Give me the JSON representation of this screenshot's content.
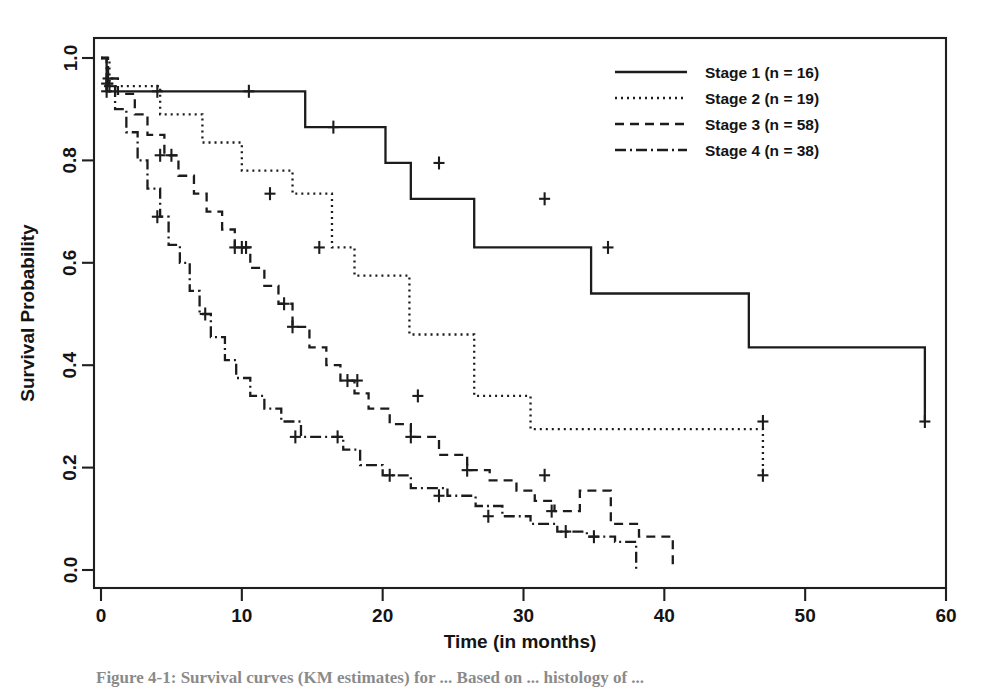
{
  "figure": {
    "caption": "Figure 4-1: Survival curves (KM estimates) for ... Based on ... histology of ...",
    "background_color": "#ffffff",
    "ink_color": "#1c1c1c"
  },
  "chart_data": {
    "type": "line",
    "subtype": "kaplan-meier-step",
    "title": "",
    "xlabel": "Time (in months)",
    "ylabel": "Survival Probability",
    "xlim": [
      0,
      60
    ],
    "ylim": [
      0,
      1.0
    ],
    "xticks": [
      0,
      10,
      20,
      30,
      40,
      50,
      60
    ],
    "xtick_labels": [
      "0",
      "10",
      "20",
      "30",
      "40",
      "50",
      "60"
    ],
    "yticks": [
      0.0,
      0.2,
      0.4,
      0.6,
      0.8,
      1.0
    ],
    "ytick_labels": [
      "0.0",
      "0.2",
      "0.4",
      "0.6",
      "0.8",
      "1.0"
    ],
    "grid": false,
    "legend_position": "top-right",
    "series": [
      {
        "name": "Stage 1 (n = 16)",
        "legend_label": "Stage 1 (n = 16)",
        "n": 16,
        "stage": 1,
        "line_style": "solid",
        "dash_pattern": "none",
        "x": [
          0,
          0.4,
          7.5,
          14.5,
          20.2,
          22.0,
          26.5,
          34.8,
          46.0,
          58.5
        ],
        "y": [
          1.0,
          0.935,
          0.935,
          0.865,
          0.795,
          0.725,
          0.63,
          0.54,
          0.435,
          0.29
        ],
        "censor_times": [
          0.4,
          4.0,
          10.5,
          16.5,
          24.0,
          31.5,
          36.0,
          47.0,
          58.5
        ],
        "censor_probs": [
          0.935,
          0.935,
          0.935,
          0.865,
          0.795,
          0.725,
          0.63,
          0.29,
          0.29
        ]
      },
      {
        "name": "Stage 2 (n = 19)",
        "legend_label": "Stage 2 (n = 19)",
        "n": 19,
        "stage": 2,
        "line_style": "dotted",
        "dash_pattern": "2 4",
        "x": [
          0,
          0.6,
          4.2,
          7.2,
          10.0,
          13.6,
          16.4,
          18.0,
          21.9,
          26.5,
          30.5,
          47.0
        ],
        "y": [
          1.0,
          0.945,
          0.89,
          0.835,
          0.78,
          0.735,
          0.63,
          0.575,
          0.46,
          0.34,
          0.275,
          0.185
        ],
        "censor_times": [
          0.6,
          12.0,
          15.5,
          22.5,
          31.5,
          47.0
        ],
        "censor_probs": [
          0.945,
          0.735,
          0.63,
          0.34,
          0.185,
          0.185
        ]
      },
      {
        "name": "Stage 3 (n = 58)",
        "legend_label": "Stage 3 (n = 58)",
        "n": 58,
        "stage": 3,
        "line_style": "dashed",
        "dash_pattern": "9 6",
        "x": [
          0,
          0.5,
          1.2,
          2.4,
          3.3,
          4.5,
          5.5,
          6.6,
          7.5,
          8.6,
          9.5,
          10.6,
          11.6,
          12.6,
          13.6,
          14.8,
          16.0,
          17.0,
          18.0,
          19.0,
          20.5,
          22.0,
          24.0,
          26.0,
          27.6,
          29.5,
          30.8,
          32.2,
          34.0,
          36.2,
          38.2,
          40.6
        ],
        "y": [
          1.0,
          0.96,
          0.93,
          0.89,
          0.85,
          0.81,
          0.77,
          0.735,
          0.7,
          0.665,
          0.63,
          0.59,
          0.555,
          0.52,
          0.475,
          0.435,
          0.4,
          0.37,
          0.345,
          0.315,
          0.285,
          0.26,
          0.225,
          0.195,
          0.175,
          0.155,
          0.135,
          0.115,
          0.155,
          0.09,
          0.065,
          0.01
        ],
        "censor_times": [
          0.5,
          4.2,
          5.0,
          9.5,
          10.0,
          10.3,
          13.0,
          13.6,
          17.5,
          18.2,
          22.0,
          26.0,
          32.0
        ],
        "censor_probs": [
          0.96,
          0.81,
          0.81,
          0.63,
          0.63,
          0.63,
          0.52,
          0.475,
          0.37,
          0.37,
          0.26,
          0.195,
          0.115
        ]
      },
      {
        "name": "Stage 4 (n = 38)",
        "legend_label": "Stage 4 (n = 38)",
        "n": 38,
        "stage": 4,
        "line_style": "dash-dot",
        "dash_pattern": "11 4 2 4",
        "x": [
          0,
          0.4,
          1.0,
          1.8,
          2.6,
          3.3,
          4.2,
          4.8,
          5.6,
          6.3,
          7.0,
          7.8,
          8.8,
          9.6,
          10.6,
          11.6,
          12.8,
          14.2,
          15.6,
          17.2,
          18.4,
          20.0,
          22.0,
          24.6,
          26.6,
          28.5,
          30.5,
          32.4,
          34.5,
          36.5,
          38.0
        ],
        "y": [
          1.0,
          0.95,
          0.9,
          0.855,
          0.8,
          0.745,
          0.69,
          0.635,
          0.6,
          0.545,
          0.5,
          0.455,
          0.41,
          0.375,
          0.34,
          0.315,
          0.29,
          0.26,
          0.26,
          0.235,
          0.205,
          0.185,
          0.16,
          0.145,
          0.125,
          0.105,
          0.09,
          0.075,
          0.065,
          0.055,
          0.0
        ],
        "censor_times": [
          0.4,
          4.0,
          7.4,
          13.8,
          16.8,
          20.5,
          24.0,
          27.5,
          33.0,
          35.0
        ],
        "censor_probs": [
          0.95,
          0.69,
          0.5,
          0.26,
          0.26,
          0.185,
          0.145,
          0.105,
          0.075,
          0.065
        ]
      }
    ]
  },
  "legend": {
    "entries": [
      {
        "label": "Stage 1 (n = 16)"
      },
      {
        "label": "Stage 2 (n = 19)"
      },
      {
        "label": "Stage 3 (n = 58)"
      },
      {
        "label": "Stage 4 (n = 38)"
      }
    ]
  }
}
